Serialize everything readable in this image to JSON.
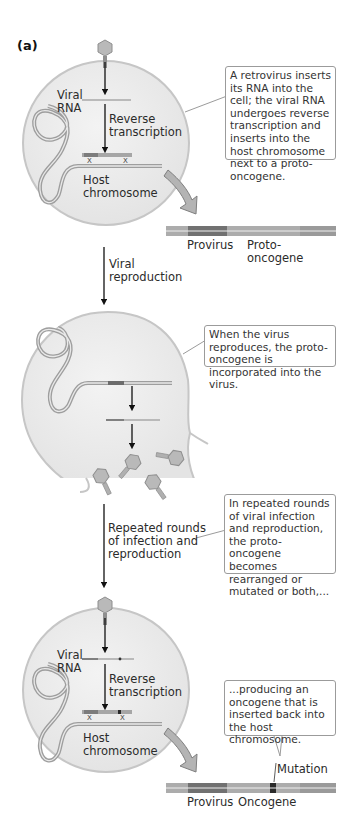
{
  "panel_label": "(a)",
  "stage1": {
    "viral_rna_label_line1": "Viral",
    "viral_rna_label_line2": "RNA",
    "rt_label_line1": "Reverse",
    "rt_label_line2": "transcription",
    "host_label_line1": "Host",
    "host_label_line2": "chromosome",
    "callout": "A retrovirus inserts its RNA into the cell; the viral RNA undergoes reverse transcription and inserts into the host chromosome next to a proto-oncogene.",
    "strip_label_provirus": "Provirus",
    "strip_label_gene_line1": "Proto-",
    "strip_label_gene_line2": "oncogene"
  },
  "transition1": {
    "label_line1": "Viral",
    "label_line2": "reproduction"
  },
  "stage2": {
    "callout": "When the virus reproduces, the proto-oncogene is incorporated into the virus."
  },
  "transition2": {
    "label_line1": "Repeated rounds",
    "label_line2": "of infection and",
    "label_line3": "reproduction",
    "callout": "In repeated rounds of viral infection and reproduction, the proto-oncogene becomes rearranged or mutated or both,..."
  },
  "stage3": {
    "viral_rna_label_line1": "Viral",
    "viral_rna_label_line2": "RNA",
    "rt_label_line1": "Reverse",
    "rt_label_line2": "transcription",
    "host_label_line1": "Host",
    "host_label_line2": "chromosome",
    "callout": "...producing an oncogene that is inserted back into the host chromosome.",
    "mutation_label": "Mutation",
    "strip_label_provirus": "Provirus",
    "strip_label_gene": "Oncogene"
  },
  "colors": {
    "cell_fill": "#ececec",
    "cell_stroke": "#c4c4c4",
    "dna_light": "#a8a8a8",
    "provirus_dark": "#6a6a6a",
    "virus_fill": "#b8b8b8",
    "mutation": "#2a2a2a"
  }
}
